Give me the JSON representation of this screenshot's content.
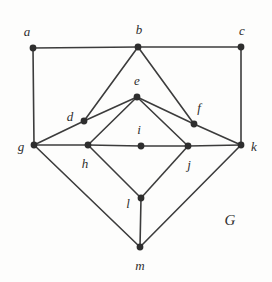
{
  "figure": {
    "width": 272,
    "height": 282,
    "background_color": "#fdfdfc",
    "edge_color": "#3c3c3c",
    "vertex_color": "#2e2e2e",
    "label_color": "#2e2e2e",
    "edge_width": 1.6,
    "vertex_radius": 3.4,
    "graph_name": "G",
    "graph_name_pos": {
      "x": 230,
      "y": 220
    }
  },
  "chart_data": {
    "type": "diagram",
    "subtype": "undirected-graph",
    "title": "G",
    "vertices": [
      {
        "id": "a",
        "label": "a",
        "x": 33,
        "y": 48,
        "label_x": 27,
        "label_y": 31
      },
      {
        "id": "b",
        "label": "b",
        "x": 138,
        "y": 47,
        "label_x": 139,
        "label_y": 29
      },
      {
        "id": "c",
        "label": "c",
        "x": 241,
        "y": 47,
        "label_x": 242,
        "label_y": 30
      },
      {
        "id": "d",
        "label": "d",
        "x": 84,
        "y": 121,
        "label_x": 70,
        "label_y": 116
      },
      {
        "id": "e",
        "label": "e",
        "x": 137,
        "y": 97,
        "label_x": 137,
        "label_y": 80
      },
      {
        "id": "f",
        "label": "f",
        "x": 194,
        "y": 124,
        "label_x": 199,
        "label_y": 107
      },
      {
        "id": "g",
        "label": "g",
        "x": 34,
        "y": 145,
        "label_x": 21,
        "label_y": 146
      },
      {
        "id": "h",
        "label": "h",
        "x": 88,
        "y": 145,
        "label_x": 85,
        "label_y": 163
      },
      {
        "id": "i",
        "label": "i",
        "x": 141,
        "y": 146,
        "label_x": 139,
        "label_y": 129
      },
      {
        "id": "j",
        "label": "j",
        "x": 188,
        "y": 146,
        "label_x": 189,
        "label_y": 164
      },
      {
        "id": "k",
        "label": "k",
        "x": 241,
        "y": 145,
        "label_x": 254,
        "label_y": 146
      },
      {
        "id": "l",
        "label": "l",
        "x": 141,
        "y": 198,
        "label_x": 128,
        "label_y": 203
      },
      {
        "id": "m",
        "label": "m",
        "x": 140,
        "y": 247,
        "label_x": 140,
        "label_y": 265
      }
    ],
    "edges": [
      {
        "from": "a",
        "to": "b"
      },
      {
        "from": "b",
        "to": "c"
      },
      {
        "from": "a",
        "to": "g"
      },
      {
        "from": "c",
        "to": "k"
      },
      {
        "from": "b",
        "to": "d"
      },
      {
        "from": "b",
        "to": "f"
      },
      {
        "from": "d",
        "to": "g"
      },
      {
        "from": "f",
        "to": "k"
      },
      {
        "from": "d",
        "to": "e"
      },
      {
        "from": "e",
        "to": "f"
      },
      {
        "from": "e",
        "to": "h"
      },
      {
        "from": "e",
        "to": "j"
      },
      {
        "from": "g",
        "to": "h"
      },
      {
        "from": "h",
        "to": "i"
      },
      {
        "from": "i",
        "to": "j"
      },
      {
        "from": "j",
        "to": "k"
      },
      {
        "from": "h",
        "to": "l"
      },
      {
        "from": "j",
        "to": "l"
      },
      {
        "from": "g",
        "to": "m"
      },
      {
        "from": "k",
        "to": "m"
      },
      {
        "from": "l",
        "to": "m"
      }
    ],
    "vertex_count": 13,
    "edge_count": 21
  }
}
